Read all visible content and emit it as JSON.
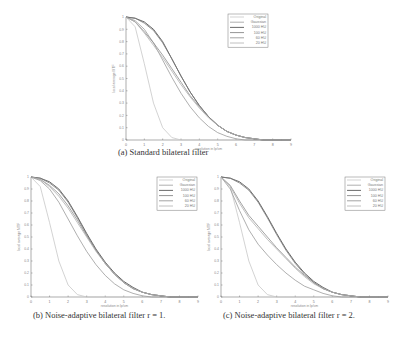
{
  "chart_data": [
    {
      "type": "line",
      "caption": "(a) Standard bilateral filter",
      "xlabel": "resolution in lp/cm",
      "ylabel": "local average MTF",
      "xlim": [
        0,
        9
      ],
      "ylim": [
        0,
        1
      ],
      "xticks": [
        "0",
        "1",
        "2",
        "3",
        "4",
        "5",
        "6",
        "7",
        "8",
        "9"
      ],
      "yticks": [
        "0",
        "0.1",
        "0.2",
        "0.3",
        "0.4",
        "0.5",
        "0.6",
        "0.7",
        "0.8",
        "0.9",
        "1"
      ],
      "legend": [
        "Original",
        "Gaussian",
        "1000 HU",
        "100 HU",
        "60 HU",
        "20 HU"
      ],
      "x": [
        0,
        0.5,
        1,
        1.5,
        2,
        2.5,
        3,
        3.5,
        4,
        4.5,
        5,
        5.5,
        6,
        6.5,
        7,
        7.5,
        8,
        8.5,
        9
      ],
      "series": [
        {
          "name": "Original",
          "color": "#c8c8c8",
          "values": [
            1,
            0.92,
            0.62,
            0.3,
            0.1,
            0.02,
            0,
            0,
            0,
            0,
            0,
            0,
            0,
            0,
            0,
            0,
            0,
            0,
            0
          ]
        },
        {
          "name": "Gaussian",
          "color": "#9a9a9a",
          "values": [
            1,
            0.97,
            0.9,
            0.79,
            0.65,
            0.51,
            0.38,
            0.27,
            0.18,
            0.11,
            0.06,
            0.03,
            0.01,
            0,
            0,
            0,
            0,
            0,
            0
          ]
        },
        {
          "name": "1000 HU",
          "color": "#444444",
          "values": [
            1,
            0.99,
            0.96,
            0.9,
            0.8,
            0.66,
            0.52,
            0.39,
            0.28,
            0.19,
            0.12,
            0.07,
            0.04,
            0.02,
            0.01,
            0,
            0,
            0,
            0
          ]
        },
        {
          "name": "100 HU",
          "color": "#777777",
          "values": [
            1,
            0.99,
            0.95,
            0.89,
            0.79,
            0.66,
            0.52,
            0.39,
            0.28,
            0.19,
            0.12,
            0.07,
            0.04,
            0.02,
            0.01,
            0,
            0,
            0,
            0
          ]
        },
        {
          "name": "60 HU",
          "color": "#8c8c8c",
          "values": [
            1,
            0.96,
            0.88,
            0.79,
            0.69,
            0.58,
            0.47,
            0.36,
            0.27,
            0.19,
            0.12,
            0.07,
            0.04,
            0.02,
            0.01,
            0,
            0,
            0,
            0
          ]
        },
        {
          "name": "20 HU",
          "color": "#b0b0b0",
          "values": [
            1,
            0.96,
            0.87,
            0.77,
            0.67,
            0.56,
            0.45,
            0.35,
            0.26,
            0.18,
            0.12,
            0.07,
            0.04,
            0.02,
            0.01,
            0,
            0,
            0,
            0
          ]
        }
      ]
    },
    {
      "type": "line",
      "caption": "(b) Noise-adaptive bilateral filter r = 1.",
      "xlabel": "resolution in lp/cm",
      "ylabel": "local average MTF",
      "xlim": [
        0,
        9
      ],
      "ylim": [
        0,
        1
      ],
      "xticks": [
        "0",
        "1",
        "2",
        "3",
        "4",
        "5",
        "6",
        "7",
        "8",
        "9"
      ],
      "yticks": [
        "0",
        "0.1",
        "0.2",
        "0.3",
        "0.4",
        "0.5",
        "0.6",
        "0.7",
        "0.8",
        "0.9",
        "1"
      ],
      "legend": [
        "Original",
        "Gaussian",
        "1000 HU",
        "100 HU",
        "60 HU",
        "20 HU"
      ],
      "x": [
        0,
        0.5,
        1,
        1.5,
        2,
        2.5,
        3,
        3.5,
        4,
        4.5,
        5,
        5.5,
        6,
        6.5,
        7,
        7.5,
        8,
        8.5,
        9
      ],
      "series": [
        {
          "name": "Original",
          "color": "#c8c8c8",
          "values": [
            1,
            0.92,
            0.62,
            0.3,
            0.1,
            0.02,
            0,
            0,
            0,
            0,
            0,
            0,
            0,
            0,
            0,
            0,
            0,
            0,
            0
          ]
        },
        {
          "name": "Gaussian",
          "color": "#9a9a9a",
          "values": [
            1,
            0.97,
            0.9,
            0.79,
            0.65,
            0.51,
            0.38,
            0.27,
            0.18,
            0.11,
            0.06,
            0.03,
            0.01,
            0,
            0,
            0,
            0,
            0,
            0
          ]
        },
        {
          "name": "1000 HU",
          "color": "#444444",
          "values": [
            1,
            0.99,
            0.96,
            0.9,
            0.8,
            0.67,
            0.53,
            0.4,
            0.29,
            0.2,
            0.13,
            0.08,
            0.04,
            0.02,
            0.01,
            0,
            0,
            0,
            0
          ]
        },
        {
          "name": "100 HU",
          "color": "#777777",
          "values": [
            1,
            0.99,
            0.95,
            0.89,
            0.79,
            0.66,
            0.52,
            0.39,
            0.28,
            0.19,
            0.12,
            0.07,
            0.04,
            0.02,
            0.01,
            0,
            0,
            0,
            0
          ]
        },
        {
          "name": "60 HU",
          "color": "#8c8c8c",
          "values": [
            1,
            0.98,
            0.93,
            0.86,
            0.76,
            0.64,
            0.51,
            0.39,
            0.28,
            0.19,
            0.12,
            0.07,
            0.04,
            0.02,
            0.01,
            0,
            0,
            0,
            0
          ]
        },
        {
          "name": "20 HU",
          "color": "#b0b0b0",
          "values": [
            1,
            0.98,
            0.92,
            0.84,
            0.74,
            0.62,
            0.5,
            0.38,
            0.28,
            0.19,
            0.12,
            0.07,
            0.04,
            0.02,
            0.01,
            0,
            0,
            0,
            0
          ]
        }
      ]
    },
    {
      "type": "line",
      "caption": "(c) Noise-adaptive bilateral filter r = 2.",
      "xlabel": "resolution in lp/cm",
      "ylabel": "local average MTF",
      "xlim": [
        0,
        9
      ],
      "ylim": [
        0,
        1
      ],
      "xticks": [
        "0",
        "1",
        "2",
        "3",
        "4",
        "5",
        "6",
        "7",
        "8",
        "9"
      ],
      "yticks": [
        "0",
        "0.1",
        "0.2",
        "0.3",
        "0.4",
        "0.5",
        "0.6",
        "0.7",
        "0.8",
        "0.9",
        "1"
      ],
      "legend": [
        "Original",
        "Gaussian",
        "1000 HU",
        "100 HU",
        "60 HU",
        "20 HU"
      ],
      "x": [
        0,
        0.5,
        1,
        1.5,
        2,
        2.5,
        3,
        3.5,
        4,
        4.5,
        5,
        5.5,
        6,
        6.5,
        7,
        7.5,
        8,
        8.5,
        9
      ],
      "series": [
        {
          "name": "Original",
          "color": "#c8c8c8",
          "values": [
            1,
            0.92,
            0.62,
            0.3,
            0.1,
            0.02,
            0,
            0,
            0,
            0,
            0,
            0,
            0,
            0,
            0,
            0,
            0,
            0,
            0
          ]
        },
        {
          "name": "Gaussian",
          "color": "#9a9a9a",
          "values": [
            1,
            0.9,
            0.72,
            0.56,
            0.44,
            0.35,
            0.27,
            0.2,
            0.14,
            0.09,
            0.06,
            0.03,
            0.01,
            0,
            0,
            0,
            0,
            0,
            0
          ]
        },
        {
          "name": "1000 HU",
          "color": "#444444",
          "values": [
            1,
            0.99,
            0.96,
            0.9,
            0.8,
            0.67,
            0.53,
            0.4,
            0.29,
            0.2,
            0.13,
            0.08,
            0.04,
            0.02,
            0.01,
            0,
            0,
            0,
            0
          ]
        },
        {
          "name": "100 HU",
          "color": "#777777",
          "values": [
            1,
            0.99,
            0.95,
            0.89,
            0.79,
            0.66,
            0.52,
            0.39,
            0.28,
            0.19,
            0.12,
            0.07,
            0.04,
            0.02,
            0.01,
            0,
            0,
            0,
            0
          ]
        },
        {
          "name": "60 HU",
          "color": "#8c8c8c",
          "values": [
            1,
            0.93,
            0.8,
            0.68,
            0.59,
            0.5,
            0.41,
            0.33,
            0.25,
            0.18,
            0.12,
            0.07,
            0.04,
            0.02,
            0.01,
            0,
            0,
            0,
            0
          ]
        },
        {
          "name": "20 HU",
          "color": "#b0b0b0",
          "values": [
            1,
            0.92,
            0.78,
            0.66,
            0.57,
            0.48,
            0.4,
            0.32,
            0.24,
            0.17,
            0.11,
            0.07,
            0.04,
            0.02,
            0.01,
            0,
            0,
            0,
            0
          ]
        }
      ]
    }
  ],
  "layout": [
    {
      "x0": 126,
      "x1": 291,
      "y0": 140,
      "y1": 17,
      "legend": [
        228,
        14
      ],
      "caption_pos": [
        117,
        152
      ]
    },
    {
      "x0": 31,
      "x1": 198,
      "y0": 297,
      "y1": 177,
      "legend": [
        157,
        177
      ],
      "caption_pos": [
        32,
        315
      ]
    },
    {
      "x0": 221,
      "x1": 388,
      "y0": 297,
      "y1": 177,
      "legend": [
        345,
        177
      ],
      "caption_pos": [
        222,
        315
      ]
    }
  ]
}
